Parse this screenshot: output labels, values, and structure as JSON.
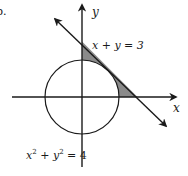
{
  "figure": {
    "problem_number": "b.",
    "axes": {
      "x_label": "x",
      "y_label": "y"
    },
    "line": {
      "equation": "x + y = 3",
      "label": "x + y = 3"
    },
    "circle": {
      "equation": "x^2 + y^2 = 4",
      "label_parts": {
        "x": "x",
        "x_exp": "2",
        "plus": " + ",
        "y": "y",
        "y_exp": "2",
        "rhs": " = 4"
      }
    },
    "shaded_region": "region between line x + y = 3 and circle x^2 + y^2 = 4 in first quadrant",
    "colors": {
      "stroke": "#1a1a1a",
      "shade": "#8a8a8a",
      "background": "#ffffff"
    }
  }
}
